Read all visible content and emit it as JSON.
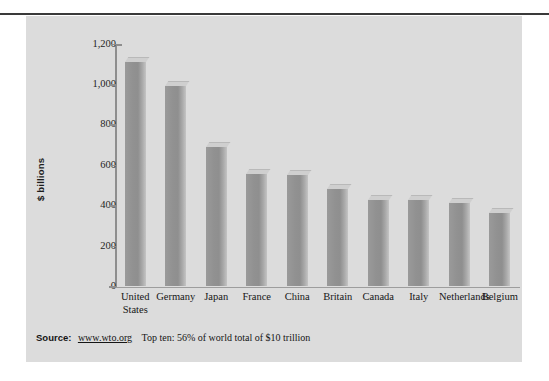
{
  "figure": {
    "background_color": "#dcdcdc",
    "rule_color": "#3a3a3a"
  },
  "source": {
    "label": "Source:",
    "url": "www.wto.org",
    "note": "Top ten: 56% of world total of $10 trillion"
  },
  "chart_data": {
    "type": "bar",
    "title": "",
    "xlabel": "",
    "ylabel": "$ billions",
    "ylim": [
      0,
      1200
    ],
    "yticks": [
      0,
      200,
      400,
      600,
      800,
      1000,
      1200
    ],
    "ytick_labels": [
      "0",
      "200",
      "400",
      "600",
      "800",
      "1,000",
      "1,200"
    ],
    "grid": false,
    "legend": "none",
    "bar_color": "#919191",
    "bar_top_color": "#cfcfcf",
    "categories": [
      "United States",
      "Germany",
      "Japan",
      "France",
      "China",
      "Britain",
      "Canada",
      "Italy",
      "Netherlands",
      "Belgium"
    ],
    "category_lines": [
      [
        "United",
        "States"
      ],
      [
        "Germany"
      ],
      [
        "Japan"
      ],
      [
        "France"
      ],
      [
        "China"
      ],
      [
        "Britain"
      ],
      [
        "Canada"
      ],
      [
        "Italy"
      ],
      [
        "Netherlands"
      ],
      [
        "Belgium"
      ]
    ],
    "values": [
      1110,
      990,
      690,
      555,
      550,
      480,
      430,
      428,
      412,
      362
    ]
  }
}
